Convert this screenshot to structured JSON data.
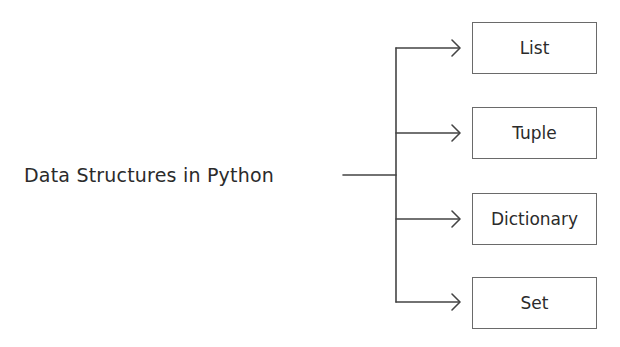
{
  "diagram": {
    "type": "tree",
    "root": {
      "label": "Data Structures in Python"
    },
    "children": [
      {
        "label": "List"
      },
      {
        "label": "Tuple"
      },
      {
        "label": "Dictionary"
      },
      {
        "label": "Set"
      }
    ],
    "colors": {
      "line": "#444444",
      "box_border": "#6a6a6a",
      "text": "#2b2b2b",
      "background": "#ffffff"
    }
  }
}
